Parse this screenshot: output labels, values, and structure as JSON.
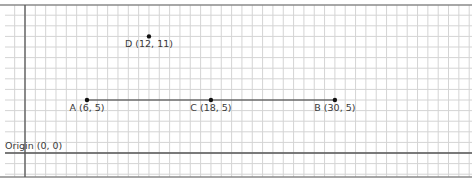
{
  "diagram": {
    "type": "coordinate-grid",
    "origin_label": "Origin (0, 0)",
    "segment": {
      "from": "A",
      "to": "B"
    },
    "points": [
      {
        "id": "A",
        "x": 6,
        "y": 5,
        "label": "A (6, 5)"
      },
      {
        "id": "C",
        "x": 18,
        "y": 5,
        "label": "C (18, 5)"
      },
      {
        "id": "B",
        "x": 30,
        "y": 5,
        "label": "B (30, 5)"
      },
      {
        "id": "D",
        "x": 12,
        "y": 11,
        "label": "D (12, 11)"
      }
    ],
    "colors": {
      "grid_minor": "#d4d4d4",
      "grid_major": "#8a8a8a",
      "axis": "#555555",
      "point": "#111111",
      "segment": "#333333",
      "label": "#3a3a3a"
    }
  }
}
